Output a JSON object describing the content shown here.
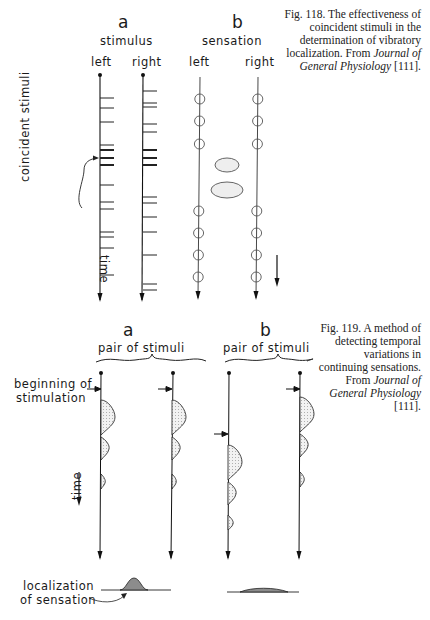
{
  "fig118": {
    "panel_a": {
      "letter": "a",
      "title": "stimulus",
      "left_label": "left",
      "right_label": "right",
      "annotation": "coincident stimuli",
      "left_ticks_y": [
        98,
        108,
        122,
        145,
        150,
        158,
        165,
        185,
        202,
        209,
        232,
        237,
        248,
        275
      ],
      "right_ticks_y": [
        91,
        103,
        107,
        124,
        132,
        150,
        158,
        165,
        197,
        203,
        217,
        232,
        255,
        284,
        290
      ],
      "coincident_ticks_y": [
        150,
        158,
        165
      ]
    },
    "panel_b": {
      "letter": "b",
      "title": "sensation",
      "left_label": "left",
      "right_label": "right",
      "left_circles_y": [
        99,
        121,
        144,
        211,
        233,
        255,
        277
      ],
      "right_circles_y": [
        99,
        121,
        144,
        211,
        233,
        255,
        277
      ],
      "ellipses": [
        {
          "cx": 227,
          "cy": 165,
          "rx": 12,
          "ry": 7
        },
        {
          "cx": 227,
          "cy": 190,
          "rx": 16,
          "ry": 8
        }
      ],
      "time_label": "time"
    },
    "caption": {
      "number": "Fig. 118.",
      "text": "The effectiveness of coincident stimuli in the determination of vibratory localization. From",
      "journal": "Journal of General Physiology",
      "ref": "[111]."
    }
  },
  "fig119": {
    "panel_a": {
      "letter": "a",
      "title": "pair of stimuli",
      "beginning_label_1": "beginning of",
      "beginning_label_2": "stimulation",
      "time_label": "time",
      "localization_label_1": "localization",
      "localization_label_2": "of sensation"
    },
    "panel_b": {
      "letter": "b",
      "title": "pair of stimuli"
    },
    "caption": {
      "number": "Fig. 119.",
      "text": "A method of detecting temporal variations in continuing sensations. From",
      "journal": "Journal of General Physiology",
      "ref": "[111]."
    }
  }
}
